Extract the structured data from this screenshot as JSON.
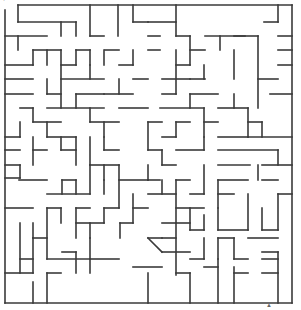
{
  "maze": {
    "cell": 14.4,
    "origin": [
      5,
      5
    ],
    "cols": 20,
    "rows": 20,
    "stroke": "#3a3a3a",
    "background": "#ffffff",
    "entrance": "top-left",
    "exit": "bottom-right",
    "walls": [
      [
        18,
        5,
        292,
        5
      ],
      [
        5,
        10,
        5,
        303
      ],
      [
        5,
        303,
        292,
        303
      ],
      [
        292,
        5,
        292,
        303
      ],
      [
        18,
        5,
        18,
        22
      ],
      [
        18,
        22,
        76,
        22
      ],
      [
        61,
        22,
        61,
        36
      ],
      [
        76,
        22,
        76,
        36
      ],
      [
        90,
        5,
        90,
        36
      ],
      [
        90,
        36,
        104,
        36
      ],
      [
        118,
        5,
        118,
        36
      ],
      [
        133,
        5,
        133,
        22
      ],
      [
        133,
        22,
        148,
        22
      ],
      [
        5,
        36,
        47,
        36
      ],
      [
        33,
        50,
        61,
        50
      ],
      [
        33,
        50,
        33,
        65
      ],
      [
        47,
        50,
        47,
        65
      ],
      [
        61,
        50,
        61,
        65
      ],
      [
        76,
        50,
        90,
        50
      ],
      [
        76,
        50,
        76,
        65
      ],
      [
        62,
        65,
        76,
        65
      ],
      [
        90,
        50,
        90,
        65
      ],
      [
        105,
        50,
        119,
        50
      ],
      [
        104,
        50,
        104,
        65
      ],
      [
        119,
        65,
        133,
        65
      ],
      [
        133,
        50,
        133,
        65
      ],
      [
        148,
        50,
        160,
        50
      ],
      [
        148,
        36,
        160,
        36
      ],
      [
        5,
        65,
        33,
        65
      ],
      [
        5,
        79,
        33,
        79
      ],
      [
        5,
        94,
        33,
        94
      ],
      [
        47,
        79,
        47,
        94
      ],
      [
        47,
        94,
        61,
        94
      ],
      [
        61,
        65,
        61,
        108
      ],
      [
        61,
        79,
        104,
        79
      ],
      [
        90,
        65,
        90,
        79
      ],
      [
        76,
        94,
        104,
        94
      ],
      [
        76,
        94,
        76,
        108
      ],
      [
        119,
        79,
        119,
        94
      ],
      [
        104,
        94,
        133,
        94
      ],
      [
        133,
        79,
        148,
        79
      ],
      [
        20,
        108,
        33,
        108
      ],
      [
        33,
        108,
        33,
        122
      ],
      [
        33,
        122,
        61,
        122
      ],
      [
        47,
        122,
        47,
        137
      ],
      [
        47,
        108,
        104,
        108
      ],
      [
        90,
        108,
        90,
        122
      ],
      [
        90,
        122,
        119,
        122
      ],
      [
        119,
        108,
        148,
        108
      ],
      [
        104,
        122,
        104,
        137
      ],
      [
        5,
        137,
        20,
        137
      ],
      [
        20,
        122,
        20,
        137
      ],
      [
        5,
        150,
        20,
        150
      ],
      [
        33,
        137,
        33,
        165
      ],
      [
        33,
        150,
        47,
        150
      ],
      [
        47,
        137,
        76,
        137
      ],
      [
        61,
        137,
        61,
        150
      ],
      [
        61,
        150,
        76,
        150
      ],
      [
        76,
        137,
        76,
        165
      ],
      [
        104,
        137,
        104,
        150
      ],
      [
        104,
        150,
        119,
        150
      ],
      [
        90,
        137,
        90,
        165
      ],
      [
        90,
        165,
        119,
        165
      ],
      [
        5,
        165,
        20,
        165
      ],
      [
        5,
        178,
        20,
        178
      ],
      [
        20,
        165,
        20,
        178
      ],
      [
        19,
        180,
        47,
        180
      ],
      [
        47,
        194,
        90,
        194
      ],
      [
        62,
        180,
        76,
        180
      ],
      [
        62,
        180,
        62,
        194
      ],
      [
        76,
        180,
        76,
        194
      ],
      [
        90,
        165,
        90,
        194
      ],
      [
        104,
        180,
        104,
        194
      ],
      [
        5,
        208,
        33,
        208
      ],
      [
        47,
        208,
        61,
        208
      ],
      [
        47,
        208,
        47,
        259
      ],
      [
        61,
        208,
        61,
        223
      ],
      [
        76,
        208,
        90,
        208
      ],
      [
        76,
        208,
        76,
        238
      ],
      [
        76,
        223,
        104,
        223
      ],
      [
        90,
        223,
        90,
        238
      ],
      [
        104,
        208,
        119,
        208
      ],
      [
        104,
        208,
        104,
        223
      ],
      [
        20,
        223,
        20,
        273
      ],
      [
        33,
        223,
        33,
        238
      ],
      [
        33,
        238,
        47,
        238
      ],
      [
        20,
        259,
        33,
        259
      ],
      [
        33,
        238,
        33,
        273
      ],
      [
        47,
        259,
        90,
        259
      ],
      [
        90,
        238,
        90,
        273
      ],
      [
        62,
        252,
        76,
        252
      ],
      [
        76,
        252,
        76,
        273
      ],
      [
        90,
        259,
        119,
        259
      ],
      [
        5,
        273,
        33,
        273
      ],
      [
        47,
        273,
        61,
        273
      ],
      [
        47,
        273,
        47,
        303
      ],
      [
        33,
        282,
        33,
        303
      ],
      [
        120,
        223,
        133,
        223
      ],
      [
        120,
        223,
        120,
        238
      ],
      [
        18,
        50,
        18,
        36
      ],
      [
        104,
        165,
        104,
        180
      ],
      [
        119,
        165,
        119,
        208
      ],
      [
        119,
        180,
        148,
        180
      ],
      [
        133,
        194,
        133,
        223
      ],
      [
        133,
        208,
        148,
        208
      ],
      [
        148,
        180,
        160,
        180
      ],
      [
        148,
        22,
        176,
        22
      ],
      [
        176,
        5,
        176,
        36
      ],
      [
        176,
        36,
        190,
        36
      ],
      [
        190,
        36,
        190,
        65
      ],
      [
        190,
        50,
        205,
        50
      ],
      [
        204,
        65,
        204,
        79
      ],
      [
        205,
        36,
        245,
        36
      ],
      [
        220,
        36,
        220,
        50
      ],
      [
        234,
        50,
        234,
        79
      ],
      [
        234,
        36,
        258,
        36
      ],
      [
        258,
        36,
        258,
        108
      ],
      [
        264,
        22,
        278,
        22
      ],
      [
        278,
        5,
        278,
        22
      ],
      [
        176,
        65,
        190,
        65
      ],
      [
        176,
        50,
        176,
        94
      ],
      [
        162,
        79,
        190,
        79
      ],
      [
        162,
        94,
        176,
        94
      ],
      [
        190,
        79,
        205,
        79
      ],
      [
        190,
        94,
        190,
        108
      ],
      [
        190,
        94,
        218,
        94
      ],
      [
        218,
        108,
        248,
        108
      ],
      [
        248,
        108,
        248,
        137
      ],
      [
        258,
        79,
        278,
        79
      ],
      [
        278,
        65,
        292,
        65
      ],
      [
        278,
        50,
        292,
        50
      ],
      [
        278,
        36,
        292,
        36
      ],
      [
        270,
        94,
        292,
        94
      ],
      [
        160,
        108,
        204,
        108
      ],
      [
        176,
        122,
        190,
        122
      ],
      [
        176,
        122,
        176,
        137
      ],
      [
        204,
        108,
        204,
        137
      ],
      [
        204,
        122,
        218,
        122
      ],
      [
        162,
        137,
        176,
        137
      ],
      [
        218,
        137,
        248,
        137
      ],
      [
        248,
        122,
        262,
        122
      ],
      [
        262,
        122,
        262,
        137
      ],
      [
        248,
        137,
        292,
        137
      ],
      [
        234,
        94,
        234,
        108
      ],
      [
        148,
        122,
        162,
        122
      ],
      [
        148,
        122,
        148,
        150
      ],
      [
        148,
        150,
        162,
        150
      ],
      [
        162,
        150,
        162,
        165
      ],
      [
        162,
        165,
        176,
        165
      ],
      [
        176,
        150,
        204,
        150
      ],
      [
        204,
        137,
        204,
        150
      ],
      [
        218,
        150,
        278,
        150
      ],
      [
        218,
        165,
        250,
        165
      ],
      [
        262,
        165,
        292,
        165
      ],
      [
        278,
        150,
        278,
        165
      ],
      [
        148,
        165,
        148,
        180
      ],
      [
        148,
        194,
        176,
        194
      ],
      [
        162,
        180,
        162,
        194
      ],
      [
        176,
        180,
        190,
        180
      ],
      [
        176,
        180,
        176,
        223
      ],
      [
        176,
        208,
        204,
        208
      ],
      [
        190,
        194,
        204,
        194
      ],
      [
        204,
        165,
        204,
        194
      ],
      [
        218,
        180,
        248,
        180
      ],
      [
        218,
        180,
        218,
        208
      ],
      [
        218,
        194,
        234,
        194
      ],
      [
        262,
        180,
        278,
        180
      ],
      [
        278,
        194,
        292,
        194
      ],
      [
        258,
        165,
        258,
        180
      ],
      [
        162,
        223,
        190,
        223
      ],
      [
        162,
        238,
        176,
        238
      ],
      [
        176,
        223,
        176,
        275
      ],
      [
        190,
        208,
        190,
        230
      ],
      [
        190,
        230,
        204,
        230
      ],
      [
        204,
        215,
        204,
        230
      ],
      [
        218,
        208,
        218,
        230
      ],
      [
        218,
        230,
        248,
        230
      ],
      [
        248,
        194,
        248,
        230
      ],
      [
        262,
        208,
        262,
        230
      ],
      [
        262,
        230,
        278,
        230
      ],
      [
        278,
        194,
        278,
        230
      ],
      [
        148,
        238,
        162,
        238
      ],
      [
        148,
        238,
        162,
        252
      ],
      [
        162,
        252,
        190,
        252
      ],
      [
        190,
        259,
        204,
        259
      ],
      [
        204,
        238,
        204,
        259
      ],
      [
        218,
        238,
        234,
        238
      ],
      [
        218,
        238,
        218,
        259
      ],
      [
        234,
        238,
        234,
        259
      ],
      [
        234,
        259,
        248,
        259
      ],
      [
        248,
        238,
        278,
        238
      ],
      [
        262,
        252,
        278,
        252
      ],
      [
        262,
        259,
        278,
        259
      ],
      [
        133,
        267,
        162,
        267
      ],
      [
        148,
        273,
        148,
        303
      ],
      [
        176,
        273,
        190,
        273
      ],
      [
        190,
        273,
        190,
        303
      ],
      [
        204,
        267,
        218,
        267
      ],
      [
        218,
        259,
        218,
        303
      ],
      [
        234,
        273,
        248,
        273
      ],
      [
        234,
        267,
        234,
        303
      ],
      [
        262,
        273,
        278,
        273
      ],
      [
        278,
        252,
        278,
        303
      ]
    ]
  },
  "labels": {
    "top_left_mark": "·",
    "bottom_right_mark": "▲"
  }
}
